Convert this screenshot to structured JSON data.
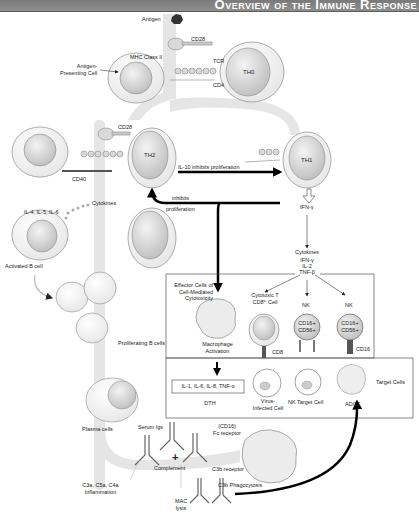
{
  "title": "Overview of the Immune Response",
  "labels": {
    "antigen": "Antigen",
    "cd28_top": "CD28",
    "mhc_class_ii": "MHC Class II",
    "tcr": "TCR",
    "cd4": "CD4",
    "apc": "Antigen-\nPresenting Cell",
    "th0": "TH0",
    "cd28_mid": "CD28",
    "cd40": "CD40",
    "th2": "TH2",
    "th1": "TH1",
    "il10": "IL-10 inhibits proliferation",
    "inhibits": "inhibits",
    "proliferation": "proliferation",
    "ifn_gamma": "IFN-γ",
    "cytokines_left": "Cytokines",
    "il_list": "IL-4, IL-5, IL-6",
    "activated_b": "Activated B cell",
    "cytokines_right": "Cytokines",
    "cytokine_list": [
      "IFN-γ",
      "IL-2",
      "TNF-β"
    ],
    "effector": "Effector Cells of\nCell-Mediated\nCytotoxicity",
    "cytotoxic_t": "Cytotoxic T\nCD8⁺ Cell",
    "nk1": "NK",
    "nk2": "NK",
    "cd16_cd56_1": "CD16+\nCD56+",
    "cd16_cd56_2": "CD16+\nCD56+",
    "macrophage": "Macrophage\nActivation",
    "cd8": "CD8",
    "cd16": "CD16",
    "proliferating_b": "Proliferating B cells",
    "il_box": "IL-1, IL-6, IL-8, TNF-α",
    "dth": "DTH",
    "virus_infected": "Virus-\nInfected Cell",
    "nk_target": "NK Target Cell",
    "adcc": "ADCC",
    "target_cells": "Target Cells",
    "plasma": "Plasma cells",
    "serum_igs": "Serum Igs",
    "fc_receptor": "(CD16)\nFc receptor",
    "c3b_receptor": "C3b receptor",
    "complement": "Complement",
    "plus": "+",
    "c3a": "C3a, C5a, C4a\nInflammation",
    "c3b_phago": "C3b Phagocytosis",
    "mac": "MAC\nlysis"
  }
}
